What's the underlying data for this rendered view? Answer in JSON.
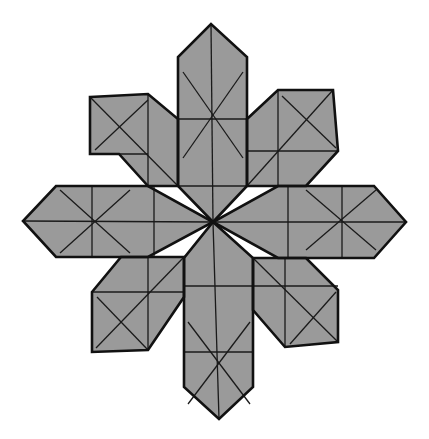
{
  "figure": {
    "title": "",
    "colors": {
      "fill": "#9a9a9a",
      "outline": "#111111",
      "crease": "#1a1a1a",
      "background": "#ffffff"
    },
    "center": [
      213,
      222
    ],
    "arms": [
      {
        "name": "top",
        "outline": "178,186 178,57 211,24 247,57 247,186 213,222",
        "creases": [
          [
            211,
            24,
            213,
            222
          ],
          [
            178,
            119,
            247,
            119
          ],
          [
            178,
            186,
            247,
            186
          ],
          [
            183,
            72,
            243,
            158
          ],
          [
            243,
            72,
            183,
            158
          ]
        ]
      },
      {
        "name": "bottom",
        "outline": "184,258 184,387 219,419 253,387 253,258 213,222",
        "creases": [
          [
            213,
            222,
            219,
            419
          ],
          [
            184,
            286,
            253,
            286
          ],
          [
            184,
            352,
            253,
            352
          ],
          [
            188,
            322,
            250,
            404
          ],
          [
            250,
            322,
            188,
            404
          ]
        ]
      },
      {
        "name": "left",
        "outline": "148,186 56,186 23,221 56,257 148,257 213,222",
        "creases": [
          [
            23,
            221,
            213,
            222
          ],
          [
            92,
            186,
            92,
            257
          ],
          [
            154,
            186,
            154,
            257
          ],
          [
            60,
            190,
            130,
            253
          ],
          [
            60,
            253,
            130,
            190
          ]
        ]
      },
      {
        "name": "right",
        "outline": "278,186 374,186 406,222 374,258 278,258 213,222",
        "creases": [
          [
            213,
            222,
            406,
            222
          ],
          [
            288,
            186,
            288,
            258
          ],
          [
            342,
            186,
            342,
            258
          ],
          [
            306,
            250,
            376,
            190
          ],
          [
            306,
            190,
            376,
            250
          ]
        ]
      },
      {
        "name": "upper-left",
        "outline": "90,97 148,94 178,119 178,186 148,186 119,154 90,154",
        "creases": [
          [
            90,
            154,
            148,
            154
          ],
          [
            148,
            94,
            148,
            186
          ],
          [
            90,
            97,
            178,
            186
          ],
          [
            95,
            150,
            148,
            100
          ]
        ]
      },
      {
        "name": "upper-right",
        "outline": "247,119 278,90 333,90 338,151 306,186 247,186",
        "creases": [
          [
            247,
            151,
            338,
            151
          ],
          [
            278,
            90,
            278,
            186
          ],
          [
            333,
            90,
            247,
            186
          ],
          [
            282,
            96,
            336,
            148
          ]
        ]
      },
      {
        "name": "lower-left",
        "outline": "92,292 121,257 184,257 184,297 148,350 92,352",
        "creases": [
          [
            92,
            292,
            184,
            292
          ],
          [
            148,
            257,
            148,
            350
          ],
          [
            184,
            257,
            96,
            348
          ],
          [
            97,
            297,
            148,
            350
          ]
        ]
      },
      {
        "name": "lower-right",
        "outline": "253,258 306,258 338,290 338,342 285,347 253,310",
        "creases": [
          [
            253,
            286,
            338,
            286
          ],
          [
            285,
            258,
            285,
            347
          ],
          [
            253,
            258,
            338,
            342
          ],
          [
            290,
            344,
            336,
            292
          ]
        ]
      }
    ]
  }
}
